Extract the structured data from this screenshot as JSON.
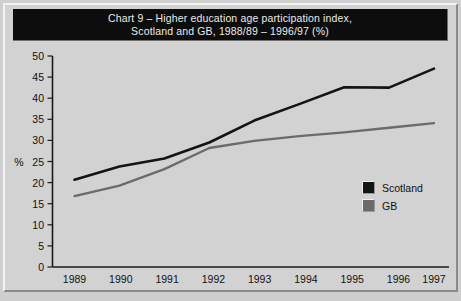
{
  "chart_data": {
    "type": "line",
    "title": "Chart 9 – Higher education age participation index, Scotland and GB, 1988/89 – 1996/97 (%)",
    "title_line1": "Chart 9 – Higher education age participation index,",
    "title_line2": "Scotland and GB, 1988/89 – 1996/97 (%)",
    "xlabel": "",
    "ylabel": "%",
    "categories": [
      "1989",
      "1990",
      "1991",
      "1992",
      "1993",
      "1994",
      "1995",
      "1996",
      "1997"
    ],
    "x": [
      1989,
      1990,
      1991,
      1992,
      1993,
      1994,
      1995,
      1996,
      1997
    ],
    "series": [
      {
        "name": "Scotland",
        "color": "#141414",
        "values": [
          20.7,
          23.8,
          25.7,
          29.5,
          34.7,
          38.6,
          42.6,
          42.5,
          47.0
        ]
      },
      {
        "name": "GB",
        "color": "#6b6b6b",
        "values": [
          16.8,
          19.3,
          23.2,
          28.2,
          29.9,
          31.0,
          31.9,
          33.0,
          34.1
        ]
      }
    ],
    "ylim": [
      0,
      50
    ],
    "yticks": [
      0,
      5,
      10,
      15,
      20,
      25,
      30,
      35,
      40,
      45,
      50
    ],
    "ytick_labels": [
      "0",
      "5",
      "10",
      "15",
      "20",
      "25",
      "30",
      "35",
      "40",
      "45",
      "50"
    ],
    "grid": false,
    "legend_position": "inside-right"
  },
  "legend": {
    "items": [
      {
        "label": "Scotland",
        "color": "#141414",
        "swatch": "legend-swatch-scotland"
      },
      {
        "label": "GB",
        "color": "#6b6b6b",
        "swatch": "legend-swatch-gb"
      }
    ]
  },
  "caption": {
    "text": ""
  }
}
